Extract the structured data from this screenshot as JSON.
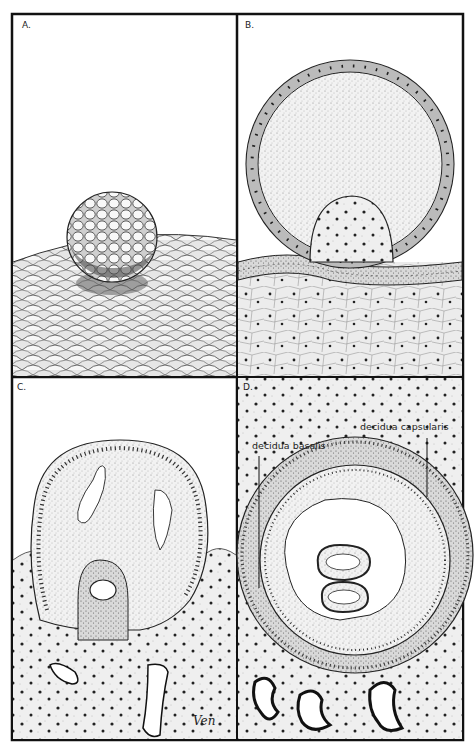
{
  "figure": {
    "panels": [
      {
        "id": "A",
        "label": "A.",
        "content": "Blastocyst (morula-like sphere) resting on endometrial epithelium surface"
      },
      {
        "id": "B",
        "label": "B.",
        "content": "Blastocyst with trophoblast ring and inner cell mass attaching to epithelium"
      },
      {
        "id": "C",
        "label": "C.",
        "content": "Blastocyst embedding into endometrial stroma with amniotic cavity forming"
      },
      {
        "id": "D",
        "label": "D.",
        "content": "Fully implanted embryo surrounded by decidua"
      }
    ],
    "annotations": {
      "decidua_basalis": "decidua basalis",
      "decidua_capsularis": "decidua capsularis"
    },
    "signature": "Ven"
  }
}
